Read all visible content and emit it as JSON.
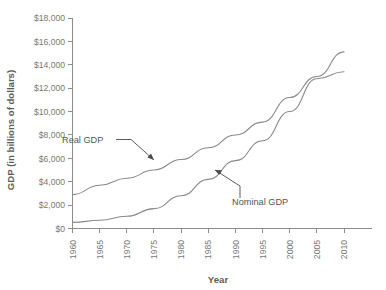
{
  "chart_data": {
    "type": "line",
    "title": "",
    "xlabel": "Year",
    "ylabel": "GDP (in billions of dollars)",
    "x": [
      1960,
      1965,
      1970,
      1975,
      1980,
      1985,
      1990,
      1995,
      2000,
      2005,
      2010
    ],
    "xlim": [
      1960,
      2010
    ],
    "ylim": [
      0,
      18000
    ],
    "grid": false,
    "legend": "none (inline annotated labels with arrows)",
    "xtick_labels": [
      "1960",
      "1965",
      "1970",
      "1975",
      "1980",
      "1985",
      "1990",
      "1995",
      "2000",
      "2005",
      "2010"
    ],
    "ytick_labels": [
      "$0",
      "$2,000",
      "$4,000",
      "$6,000",
      "$8,000",
      "$10,000",
      "$12,000",
      "$14,000",
      "$16,000",
      "$18,000"
    ],
    "ytick_values": [
      0,
      2000,
      4000,
      6000,
      8000,
      10000,
      12000,
      14000,
      16000,
      18000
    ],
    "series": [
      {
        "name": "Real GDP",
        "values": [
          2900,
          3700,
          4300,
          5000,
          5900,
          6900,
          8000,
          9100,
          11200,
          13000,
          15100
        ]
      },
      {
        "name": "Nominal GDP",
        "values": [
          520,
          700,
          1050,
          1700,
          2800,
          4200,
          5800,
          7500,
          10000,
          12800,
          13400
        ]
      }
    ],
    "annotations": [
      {
        "text": "Real GDP",
        "points_to_series": "Real GDP",
        "arrow_direction": "down-right"
      },
      {
        "text": "Nominal GDP",
        "points_to_series": "Nominal GDP",
        "arrow_direction": "up-left"
      }
    ]
  },
  "axis": {
    "y_title": "GDP (in billions of dollars)",
    "x_title": "Year"
  },
  "labels": {
    "real": "Real GDP",
    "nominal": "Nominal GDP"
  },
  "colors": {
    "line": "#8a8a8a",
    "axis": "#8c8c8c",
    "text": "#777777",
    "annotation": "#4a4a4a",
    "background": "#ffffff"
  }
}
